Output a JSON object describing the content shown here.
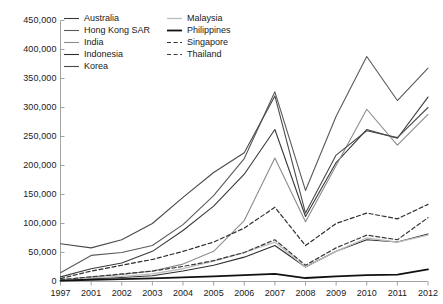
{
  "chart_data": {
    "type": "line",
    "title": "",
    "xlabel": "",
    "ylabel": "",
    "grid": false,
    "legend_position": "top-left",
    "x": [
      "1997",
      "2001",
      "2002",
      "2003",
      "2004",
      "2005",
      "2006",
      "2007",
      "2008",
      "2009",
      "2010",
      "2011",
      "2012"
    ],
    "ylim": [
      0,
      450000
    ],
    "yticks": [
      0,
      50000,
      100000,
      150000,
      200000,
      250000,
      300000,
      350000,
      400000,
      450000
    ],
    "ytick_labels": [
      "0",
      "50,000",
      "100,000",
      "150,000",
      "200,000",
      "250,000",
      "300,000",
      "350,000",
      "400,000",
      "450,000"
    ],
    "series": [
      {
        "name": "Australia",
        "color": "#3a3a3a",
        "style": "solid",
        "width": 1.1,
        "values": [
          8000,
          22000,
          32000,
          52000,
          88000,
          130000,
          185000,
          262000,
          112000,
          205000,
          262000,
          247000,
          318000
        ]
      },
      {
        "name": "Hong Kong SAR",
        "color": "#5a5a5a",
        "style": "solid",
        "width": 1.1,
        "values": [
          15000,
          45000,
          50000,
          62000,
          98000,
          148000,
          212000,
          327000,
          157000,
          285000,
          388000,
          312000,
          368000
        ]
      },
      {
        "name": "India",
        "color": "#8c8c8c",
        "style": "solid",
        "width": 1.1,
        "values": [
          3000,
          8000,
          12000,
          18000,
          30000,
          52000,
          105000,
          213000,
          103000,
          200000,
          297000,
          235000,
          288000
        ]
      },
      {
        "name": "Indonesia",
        "color": "#2e2e2e",
        "style": "solid",
        "width": 1.1,
        "values": [
          2000,
          5000,
          7000,
          10000,
          18000,
          28000,
          42000,
          62000,
          25000,
          52000,
          72000,
          68000,
          82000
        ]
      },
      {
        "name": "Korea",
        "color": "#4a4a4a",
        "style": "solid",
        "width": 1.1,
        "values": [
          65000,
          58000,
          72000,
          100000,
          145000,
          188000,
          222000,
          320000,
          118000,
          218000,
          260000,
          248000,
          300000
        ]
      },
      {
        "name": "Malaysia",
        "color": "#bdbdbd",
        "style": "solid",
        "width": 1.3,
        "values": [
          3000,
          6000,
          9000,
          13000,
          22000,
          35000,
          50000,
          68000,
          25000,
          52000,
          75000,
          68000,
          80000
        ]
      },
      {
        "name": "Philippines",
        "color": "#111111",
        "style": "solid",
        "width": 1.8,
        "values": [
          1500,
          3000,
          4000,
          5500,
          7000,
          9000,
          11000,
          13000,
          6000,
          9000,
          11000,
          12000,
          21000
        ]
      },
      {
        "name": "Singapore",
        "color": "#2e2e2e",
        "style": "dashed",
        "width": 1.2,
        "values": [
          5000,
          18000,
          28000,
          38000,
          52000,
          68000,
          92000,
          128000,
          62000,
          100000,
          118000,
          108000,
          133000
        ]
      },
      {
        "name": "Thailand",
        "color": "#3a3a3a",
        "style": "dashed",
        "width": 1.2,
        "values": [
          3000,
          8000,
          13000,
          18000,
          26000,
          36000,
          50000,
          72000,
          28000,
          58000,
          80000,
          72000,
          110000
        ]
      }
    ]
  },
  "legend": {
    "left_items": [
      "Australia",
      "Hong Kong SAR",
      "India",
      "Indonesia",
      "Korea"
    ],
    "right_items": [
      "Malaysia",
      "Philippines",
      "Singapore",
      "Thailand"
    ]
  },
  "axis": {
    "color": "#999999",
    "text_color": "#1a1a1a"
  }
}
